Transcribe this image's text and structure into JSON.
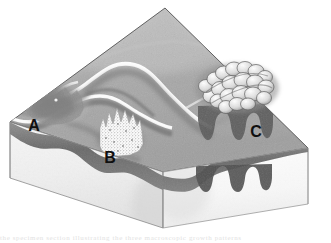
{
  "figure": {
    "background_color": "#ffffff",
    "ink_color": "#101010",
    "caption_fragment": "the specimen section illustrating the three macroscopic growth patterns"
  },
  "block": {
    "name": "tissue-block",
    "top_surface_label": "mucosal surface",
    "top_surface_color": "#b9b9b9",
    "left_face_color": "#f2f2f2",
    "right_face_color": "#fbfbfb",
    "mucosa_band_color": "#6f6f6f",
    "submucosa_color": "#e9e9e9",
    "outline_color": "#6a6a6a",
    "vertices": {
      "back_apex": "165,8",
      "left_apex": "10,122",
      "right_apex": "308,148",
      "front_apex": "163,172",
      "front_bottom": "163,228",
      "left_bottom": "10,178",
      "right_bottom": "308,204"
    }
  },
  "lesions": [
    {
      "id": "A",
      "label": "A",
      "name": "lesion-a-flat-infiltrative",
      "pattern": "flat diffuse infiltrating lesion",
      "surface": "flat, ill-defined, dark shaded plaque",
      "label_position": "34,131",
      "label_font_size": 16,
      "shade_color": "#8a8a8a"
    },
    {
      "id": "B",
      "label": "B",
      "name": "lesion-b-granular-polypoid",
      "pattern": "stippled granular polypoid lesion",
      "surface": "finely stippled nodular dome",
      "label_position": "110,163",
      "label_font_size": 16,
      "shade_color": "#fdfdfd"
    },
    {
      "id": "C",
      "label": "C",
      "name": "lesion-c-exophytic-fungating",
      "pattern": "exophytic cauliflower-like fungating mass",
      "surface": "lobulated papillary cauliflower mass on a broad base",
      "label_position": "256,137",
      "label_font_size": 16,
      "shade_color": "#d9d9d9"
    }
  ],
  "labels": {
    "a": "A",
    "b": "B",
    "c": "C"
  }
}
